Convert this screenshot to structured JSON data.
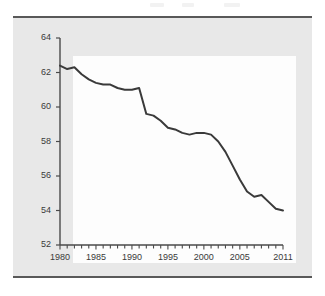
{
  "figure": {
    "background_color": "#ffffff",
    "panel_color": "#e8e8e8",
    "plot_background_color": "#fdfdfd",
    "frame_color": "#595959",
    "axis_color": "#4a4a4a",
    "line_color": "#3a3a3a",
    "tick_text_color": "#3a3a3a"
  },
  "chart_data": {
    "type": "line",
    "title": "",
    "subtitle": "",
    "xlabel": "",
    "ylabel": "",
    "xlim": [
      1980,
      2011
    ],
    "ylim": [
      52,
      64
    ],
    "grid": false,
    "legend": false,
    "legend_position": "none",
    "x_tick_labels": [
      "1980",
      "1985",
      "1990",
      "1995",
      "2000",
      "2005",
      "2011"
    ],
    "x_tick_values": [
      1980,
      1985,
      1990,
      1995,
      2000,
      2005,
      2011
    ],
    "x_minor_ticks_every": 1,
    "y_tick_labels": [
      "52",
      "54",
      "56",
      "58",
      "60",
      "62",
      "64"
    ],
    "y_tick_values": [
      52,
      54,
      56,
      58,
      60,
      62,
      64
    ],
    "series": [
      {
        "name": "series-1",
        "color": "#3a3a3a",
        "line_width": 2.0,
        "x": [
          1980,
          1981,
          1982,
          1983,
          1984,
          1985,
          1986,
          1987,
          1988,
          1989,
          1990,
          1991,
          1992,
          1993,
          1994,
          1995,
          1996,
          1997,
          1998,
          1999,
          2000,
          2001,
          2002,
          2003,
          2004,
          2005,
          2006,
          2007,
          2008,
          2009,
          2010,
          2011
        ],
        "values": [
          62.4,
          62.2,
          62.3,
          61.9,
          61.6,
          61.4,
          61.3,
          61.3,
          61.1,
          61.0,
          61.0,
          61.1,
          59.6,
          59.5,
          59.2,
          58.8,
          58.7,
          58.5,
          58.4,
          58.5,
          58.5,
          58.4,
          58.0,
          57.4,
          56.6,
          55.8,
          55.1,
          54.8,
          54.9,
          54.5,
          54.1,
          54.0
        ]
      }
    ]
  }
}
